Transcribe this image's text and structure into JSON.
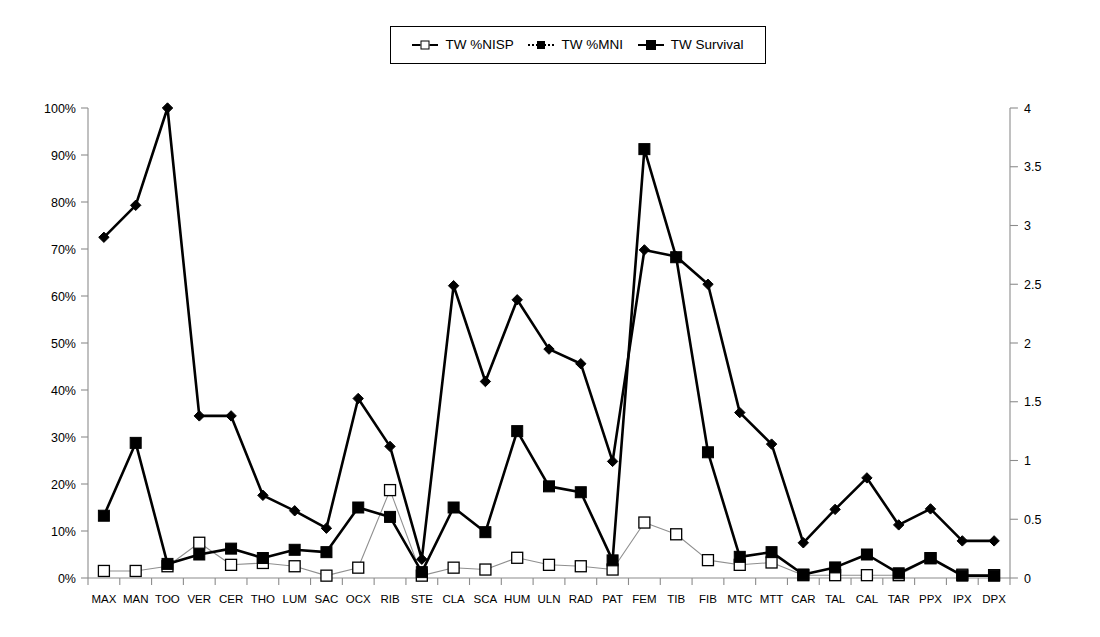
{
  "legend": {
    "position": "top-center",
    "items": [
      {
        "label": "TW %NISP",
        "marker": "open-square",
        "line": "thin",
        "axis": "left"
      },
      {
        "label": "TW %MNI",
        "marker": "filled-diamond",
        "line": "thick",
        "axis": "left"
      },
      {
        "label": "TW Survival",
        "marker": "filled-square",
        "line": "thick",
        "axis": "right"
      }
    ]
  },
  "axes": {
    "left": {
      "ticks": [
        "0%",
        "10%",
        "20%",
        "30%",
        "40%",
        "50%",
        "60%",
        "70%",
        "80%",
        "90%",
        "100%"
      ],
      "min": 0,
      "max": 100,
      "step": 10,
      "unit": "%"
    },
    "right": {
      "ticks": [
        "0",
        "0.5",
        "1",
        "1.5",
        "2",
        "2.5",
        "3",
        "3.5",
        "4"
      ],
      "min": 0,
      "max": 4,
      "step": 0.5,
      "unit": ""
    },
    "x": {
      "label": ""
    }
  },
  "chart_data": {
    "type": "line",
    "title": "",
    "xlabel": "",
    "ylabel": "",
    "grid": false,
    "legend_position": "top-center",
    "categories": [
      "MAX",
      "MAN",
      "TOO",
      "VER",
      "CER",
      "THO",
      "LUM",
      "SAC",
      "OCX",
      "RIB",
      "STE",
      "CLA",
      "SCA",
      "HUM",
      "ULN",
      "RAD",
      "PAT",
      "FEM",
      "TIB",
      "FIB",
      "MTC",
      "MTT",
      "CAR",
      "TAL",
      "CAL",
      "TAR",
      "PPX",
      "IPX",
      "DPX"
    ],
    "ylim": [
      0,
      100
    ],
    "y2lim": [
      0,
      4
    ],
    "series": [
      {
        "name": "TW %NISP",
        "axis": "left",
        "unit": "%",
        "marker": "open-square",
        "line": "thin",
        "values": [
          1.5,
          1.5,
          2.5,
          7.5,
          2.8,
          3.2,
          2.5,
          0.5,
          2.2,
          18.7,
          0.5,
          2.2,
          1.8,
          4.3,
          2.8,
          2.5,
          1.8,
          11.8,
          9.3,
          3.8,
          2.8,
          3.3,
          0.6,
          0.6,
          0.6,
          0.6,
          4.2,
          0.7,
          0.6
        ]
      },
      {
        "name": "TW %MNI",
        "axis": "left",
        "unit": "%",
        "marker": "filled-diamond",
        "line": "thick",
        "values": [
          72.5,
          79.3,
          100.0,
          34.5,
          34.5,
          17.6,
          14.3,
          10.6,
          38.2,
          28.0,
          4.0,
          62.2,
          41.8,
          59.2,
          48.7,
          45.6,
          24.8,
          69.8,
          68.4,
          62.5,
          35.2,
          28.5,
          7.5,
          14.6,
          21.3,
          11.3,
          14.7,
          7.9,
          7.9
        ]
      },
      {
        "name": "TW Survival",
        "axis": "right",
        "unit": "",
        "marker": "filled-square",
        "line": "thick",
        "values": [
          0.53,
          1.15,
          0.12,
          0.2,
          0.25,
          0.17,
          0.24,
          0.22,
          0.6,
          0.52,
          0.05,
          0.6,
          0.39,
          1.25,
          0.78,
          0.73,
          0.15,
          3.65,
          2.73,
          1.07,
          0.18,
          0.22,
          0.03,
          0.09,
          0.2,
          0.04,
          0.17,
          0.02,
          0.02
        ]
      }
    ]
  }
}
